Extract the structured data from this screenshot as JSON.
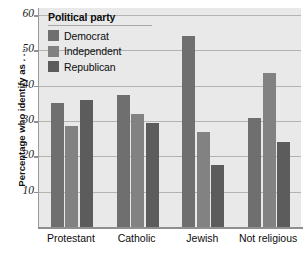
{
  "chart_data": {
    "type": "bar",
    "title": "",
    "xlabel": "",
    "ylabel": "Percentage who identify as . . .",
    "categories": [
      "Protestant",
      "Catholic",
      "Jewish",
      "Not religious"
    ],
    "series": [
      {
        "name": "Democrat",
        "color": "#6f6f6f",
        "values": [
          35,
          37.5,
          54,
          31
        ]
      },
      {
        "name": "Independent",
        "color": "#828282",
        "values": [
          28.5,
          32,
          27,
          43.5
        ]
      },
      {
        "name": "Republican",
        "color": "#5c5c5c",
        "values": [
          36,
          29.5,
          17.5,
          24
        ]
      }
    ],
    "ylim": [
      0,
      62
    ],
    "yticks": [
      10,
      20,
      30,
      40,
      50,
      60
    ],
    "ytick_labels": [
      "10",
      "20",
      "30",
      "40",
      "50",
      "60"
    ],
    "grid": true,
    "legend_position": "top-left",
    "legend_title": "Political party",
    "plot_background": "#e9e9e9",
    "grid_color": "#b3b3b3",
    "axis_color": "#8f8f8f"
  },
  "legend": {
    "title": "Political party",
    "entries": [
      {
        "label": "Democrat"
      },
      {
        "label": "Independent"
      },
      {
        "label": "Republican"
      }
    ]
  },
  "axes": {
    "y_title": "Percentage who identify as . . .",
    "y_ticks": [
      "10",
      "20",
      "30",
      "40",
      "50",
      "60"
    ],
    "x_categories": [
      "Protestant",
      "Catholic",
      "Jewish",
      "Not religious"
    ]
  }
}
